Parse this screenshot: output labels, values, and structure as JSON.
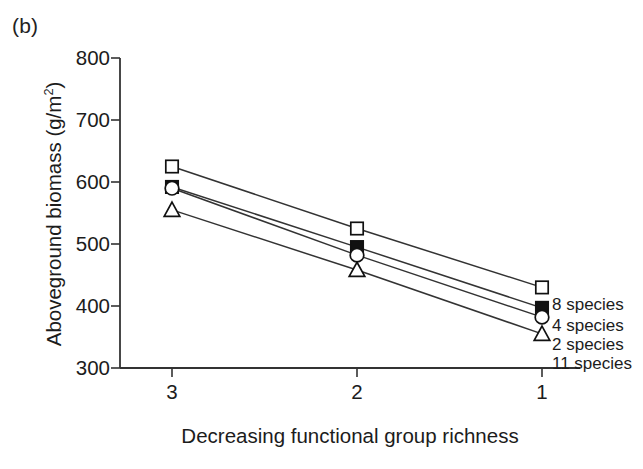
{
  "figure": {
    "panel_label": "(b)",
    "background_color": "#ffffff",
    "line_color": "#333333",
    "text_color": "#1c1c1c"
  },
  "chart_data": {
    "type": "line",
    "title": "",
    "subtitle": "",
    "xlabel": "Decreasing functional group richness",
    "ylabel": "Aboveground biomass (g/m²)",
    "x": [
      3,
      2,
      1
    ],
    "xticklabels": [
      "3",
      "2",
      "1"
    ],
    "yticklabels": [
      "300",
      "400",
      "500",
      "600",
      "700",
      "800"
    ],
    "yticks": [
      300,
      400,
      500,
      600,
      700,
      800
    ],
    "xlim": [
      3.35,
      0.72
    ],
    "ylim": [
      300,
      800
    ],
    "grid": false,
    "legend_position": "right-inline-at-last-point",
    "series": [
      {
        "name": "8 species",
        "marker": "open-square",
        "values": [
          625,
          525,
          430
        ]
      },
      {
        "name": "4 species",
        "marker": "filled-square",
        "values": [
          592,
          495,
          397
        ]
      },
      {
        "name": "2 species",
        "marker": "open-circle",
        "values": [
          590,
          482,
          382
        ]
      },
      {
        "name": "11 species",
        "marker": "open-triangle",
        "values": [
          555,
          458,
          355
        ]
      }
    ]
  },
  "legend": {
    "items": [
      {
        "label": "8 species",
        "marker": "open-square"
      },
      {
        "label": "4 species",
        "marker": "filled-square"
      },
      {
        "label": "2 species",
        "marker": "open-circle"
      },
      {
        "label": "11 species",
        "marker": "open-triangle"
      }
    ]
  }
}
